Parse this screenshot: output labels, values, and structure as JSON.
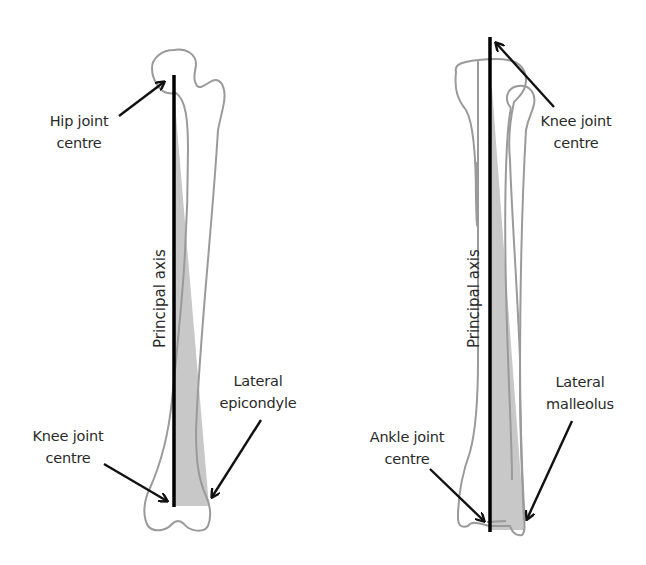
{
  "colors": {
    "bone_outline": "#9a9a9a",
    "axis_line": "#000000",
    "shading": "#c8c8c8",
    "arrow": "#111111",
    "text": "#2a2a2a",
    "background": "#ffffff"
  },
  "femur_panel": {
    "bone": "Femur",
    "axis_label": "Principal axis",
    "labels": {
      "hip_joint_centre": [
        "Hip joint",
        "centre"
      ],
      "knee_joint_centre": [
        "Knee joint",
        "centre"
      ],
      "lateral_epicondyle": [
        "Lateral",
        "epicondyle"
      ]
    }
  },
  "tibia_panel": {
    "bone": "Tibia and fibula",
    "axis_label": "Principal axis",
    "labels": {
      "knee_joint_centre": [
        "Knee joint",
        "centre"
      ],
      "ankle_joint_centre": [
        "Ankle joint",
        "centre"
      ],
      "lateral_malleolus": [
        "Lateral",
        "malleolus"
      ]
    }
  }
}
